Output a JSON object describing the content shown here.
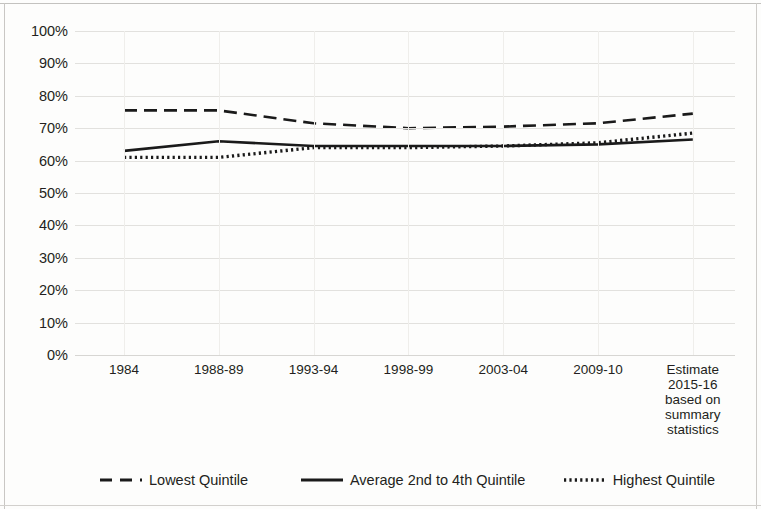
{
  "chart_data": {
    "type": "line",
    "title": "",
    "subtitle": "",
    "xlabel": "",
    "ylabel": "",
    "ylim": [
      0,
      100
    ],
    "y_tick_format": "percent",
    "grid": true,
    "legend_position": "bottom",
    "categories": [
      "1984",
      "1988-89",
      "1993-94",
      "1998-99",
      "2003-04",
      "2009-10",
      "Estimate 2015-16 based on summary statistics"
    ],
    "x_tick_labels": [
      [
        "1984"
      ],
      [
        "1988-89"
      ],
      [
        "1993-94"
      ],
      [
        "1998-99"
      ],
      [
        "2003-04"
      ],
      [
        "2009-10"
      ],
      [
        "Estimate",
        "2015-16",
        "based on",
        "summary",
        "statistics"
      ]
    ],
    "yticks": [
      "0%",
      "10%",
      "20%",
      "30%",
      "40%",
      "50%",
      "60%",
      "70%",
      "80%",
      "90%",
      "100%"
    ],
    "ytick_values": [
      0,
      10,
      20,
      30,
      40,
      50,
      60,
      70,
      80,
      90,
      100
    ],
    "series": [
      {
        "name": "Lowest Quintile",
        "style": "dashed",
        "color": "#1a1a1a",
        "values": [
          75.5,
          75.5,
          71.5,
          70.0,
          70.5,
          71.5,
          74.5
        ]
      },
      {
        "name": "Average 2nd to 4th Quintile",
        "style": "solid",
        "color": "#1a1a1a",
        "values": [
          63.0,
          66.0,
          64.5,
          64.5,
          64.5,
          65.0,
          66.5
        ]
      },
      {
        "name": "Highest Quintile",
        "style": "dotted",
        "color": "#1a1a1a",
        "values": [
          61.0,
          61.0,
          64.0,
          64.0,
          64.5,
          65.5,
          68.5
        ]
      }
    ]
  },
  "legend": {
    "items": [
      {
        "label": "Lowest Quintile",
        "style": "dashed"
      },
      {
        "label": "Average 2nd to 4th Quintile",
        "style": "solid"
      },
      {
        "label": "Highest Quintile",
        "style": "dotted"
      }
    ]
  }
}
